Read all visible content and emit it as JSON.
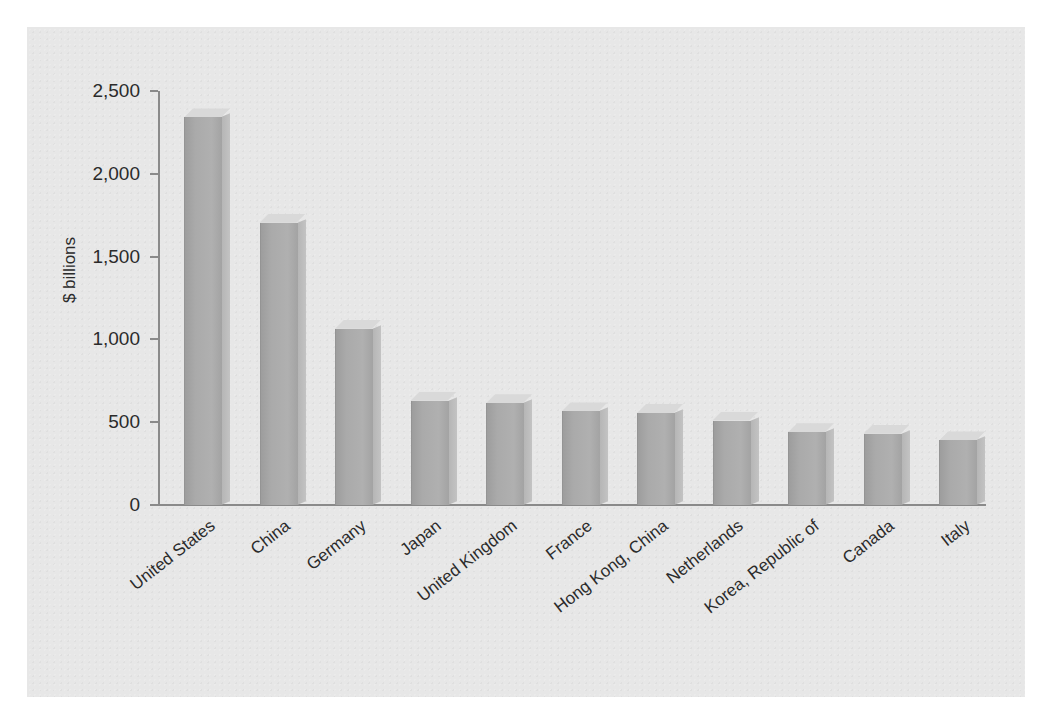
{
  "chart_data": {
    "type": "bar",
    "title": "",
    "xlabel": "",
    "ylabel": "$ billions",
    "ylim": [
      0,
      2500
    ],
    "ytick_labels": [
      "0",
      "500",
      "1,000",
      "1,500",
      "2,000",
      "2,500"
    ],
    "yticks": [
      0,
      500,
      1000,
      1500,
      2000,
      2500
    ],
    "grid": false,
    "legend": "none",
    "orientation": "vertical",
    "style": "3d-column",
    "categories": [
      "United States",
      "China",
      "Germany",
      "Japan",
      "United Kingdom",
      "France",
      "Hong Kong, China",
      "Netherlands",
      "Korea, Republic of",
      "Canada",
      "Italy"
    ],
    "values": [
      2340,
      1705,
      1065,
      630,
      615,
      565,
      555,
      510,
      440,
      430,
      390
    ],
    "colors": {
      "bar_front": "#aaaaaa",
      "bar_top": "#d7d7d7",
      "bar_side": "#bcbcbc",
      "axis": "#8a8a8a",
      "text": "#2b2b2b",
      "panel_background": "#e7e7e7",
      "page_background": "#ffffff"
    }
  }
}
